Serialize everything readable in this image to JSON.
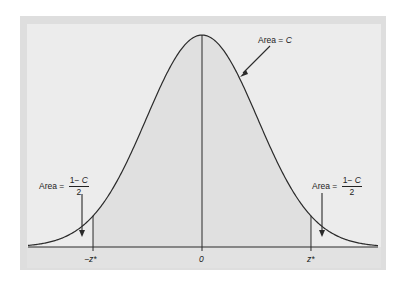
{
  "figure": {
    "type": "normal-distribution-diagram",
    "colors": {
      "outer_frame": "#dedede",
      "panel": "#ececec",
      "shaded_area": "#e0e0e0",
      "axis_band": "#e2e2e2",
      "ink": "#2a2a2a"
    },
    "center_label": {
      "prefix": "Area = ",
      "var": "C"
    },
    "left_label": {
      "prefix": "Area = ",
      "numerator": "1− C",
      "numerator_var": "C",
      "numerator_pre": "1− ",
      "denominator": "2"
    },
    "right_label": {
      "prefix": "Area = ",
      "numerator_pre": "1− ",
      "numerator_var": "C",
      "denominator": "2"
    },
    "ticks": [
      {
        "label": "−z*",
        "x": -1.96
      },
      {
        "label": "0",
        "x": 0
      },
      {
        "label": "z*",
        "x": 1.96
      }
    ]
  }
}
